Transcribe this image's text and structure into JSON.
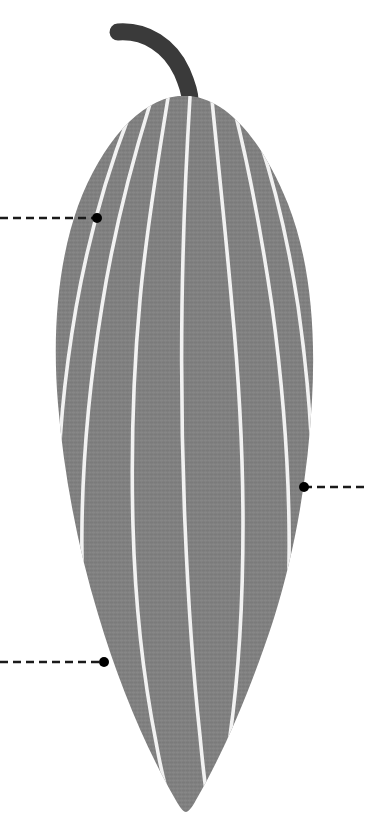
{
  "canvas": {
    "width": 368,
    "height": 826,
    "background_color": "#ffffff"
  },
  "figure": {
    "style": "flat vector illustration with textured fill"
  },
  "colors": {
    "background": "#ffffff",
    "body_fill": "#808080",
    "body_fill_shadow": "#787878",
    "body_texture_light": "#8a8a8a",
    "body_texture_dark": "#757575",
    "stripe": "#f2f2f2",
    "stem": "#3a3a3a",
    "callout_line": "#1a1a1a",
    "callout_dot": "#000000"
  },
  "body": {
    "name": "gourd-body",
    "bounds": {
      "left": 49,
      "top": 95,
      "right": 313,
      "bottom": 814
    },
    "outline_path": "M 190 96 C 228 100 262 140 288 204 C 310 260 316 330 312 400 C 308 474 296 548 274 618 C 252 686 224 752 196 800 C 192 808 188 812 186 812 C 183 812 179 806 174 797 C 146 748 118 682 98 614 C 78 548 64 476 58 404 C 52 332 58 262 78 206 C 102 142 140 100 178 96 Z",
    "stripe_count": 7
  },
  "stripes": [
    {
      "name": "stripe-1",
      "path": "M 168 98 C 158 160 146 232 140 300 C 133 376 131 452 133 526 C 135 600 143 676 156 742 C 161 770 167 794 172 808"
    },
    {
      "name": "stripe-2",
      "path": "M 150 104 C 132 162 113 236 102 306 C 90 380 83 452 82 524 C 81 598 86 672 98 736 C 104 768 113 792 121 806"
    },
    {
      "name": "stripe-3",
      "path": "M 129 116 C 108 170 88 240 76 308 C 64 378 58 444 58 504 C 58 566 64 630 76 684"
    },
    {
      "name": "stripe-4",
      "path": "M 190 97 C 186 162 183 236 182 306 C 181 380 182 452 185 524 C 188 598 193 672 200 736 C 203 768 206 794 209 810"
    },
    {
      "name": "stripe-5",
      "path": "M 212 100 C 218 162 226 236 232 306 C 239 380 243 452 243 524 C 243 598 239 672 230 736 C 225 768 219 792 213 806"
    },
    {
      "name": "stripe-6",
      "path": "M 234 108 C 248 164 262 238 272 306 C 282 380 288 452 289 524 C 290 596 286 668 276 730 C 270 762 262 788 254 802"
    },
    {
      "name": "stripe-7",
      "path": "M 254 124 C 272 174 288 240 298 306 C 308 376 313 444 313 504 C 313 564 308 624 298 676"
    }
  ],
  "stem": {
    "name": "gourd-stem",
    "path": "M 118 32 C 146 30 170 46 182 72 C 188 86 190 94 190 100",
    "stroke_width": 17,
    "color": "#3a3a3a",
    "tip_start": {
      "x": 118,
      "y": 32
    },
    "tip_end": {
      "x": 190,
      "y": 100
    }
  },
  "callouts": [
    {
      "id": "callout-1",
      "name": "callout-upper-left",
      "side": "left",
      "dot": {
        "x": 97,
        "y": 218,
        "radius": 5
      },
      "line": {
        "x1": 0,
        "y1": 218,
        "x2": 97,
        "y2": 218
      },
      "dash_pattern": "8 5",
      "stroke_width": 2.4,
      "label": ""
    },
    {
      "id": "callout-2",
      "name": "callout-middle-right",
      "side": "right",
      "dot": {
        "x": 304,
        "y": 487,
        "radius": 5
      },
      "line": {
        "x1": 304,
        "y1": 487,
        "x2": 368,
        "y2": 487
      },
      "dash_pattern": "8 5",
      "stroke_width": 2.4,
      "label": ""
    },
    {
      "id": "callout-3",
      "name": "callout-lower-left",
      "side": "left",
      "dot": {
        "x": 104,
        "y": 662,
        "radius": 5
      },
      "line": {
        "x1": 0,
        "y1": 662,
        "x2": 104,
        "y2": 662
      },
      "dash_pattern": "8 5",
      "stroke_width": 2.4,
      "label": ""
    }
  ]
}
